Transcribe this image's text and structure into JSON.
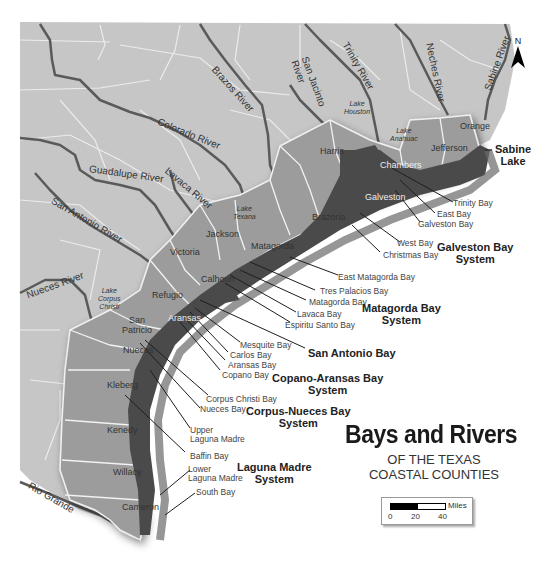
{
  "title": {
    "main": "Bays and Rivers",
    "subtitle_line1": "OF THE TEXAS",
    "subtitle_line2": "COASTAL COUNTIES"
  },
  "north_arrow": {
    "label": "N"
  },
  "scale_bar": {
    "unit": "Miles",
    "ticks": [
      "0",
      "20",
      "40"
    ]
  },
  "rivers": [
    {
      "name": "Brazos River"
    },
    {
      "name": "Colorado River"
    },
    {
      "name": "Guadalupe River"
    },
    {
      "name": "Lavaca River"
    },
    {
      "name": "San Antonio River"
    },
    {
      "name": "Nueces River"
    },
    {
      "name": "Rio Grande"
    },
    {
      "name": "San Jacinto River",
      "line1": "San Jacinto",
      "line2": "River"
    },
    {
      "name": "Trinity River"
    },
    {
      "name": "Neches River"
    },
    {
      "name": "Sabine River"
    }
  ],
  "lakes": [
    {
      "line1": "Lake",
      "line2": "Houston"
    },
    {
      "line1": "Lake",
      "line2": "Anahuac"
    },
    {
      "line1": "Lake",
      "line2": "Texana"
    },
    {
      "line1": "Lake",
      "line2": "Corpus",
      "line3": "Christi"
    }
  ],
  "counties": [
    "Harris",
    "Chambers",
    "Jefferson",
    "Orange",
    "Galveston",
    "Brazoria",
    "Matagorda",
    "Jackson",
    "Victoria",
    "Calhoun",
    "Refugio",
    "Aransas",
    "San Patricio",
    "Nueces",
    "Kleberg",
    "Kenedy",
    "Willacy",
    "Cameron"
  ],
  "san_patricio": {
    "line1": "San",
    "line2": "Patricio"
  },
  "bays": [
    "Trinity Bay",
    "East Bay",
    "Galveston Bay",
    "West Bay",
    "Christmas Bay",
    "East Matagorda Bay",
    "Tres Palacios Bay",
    "Matagorda Bay",
    "Lavaca Bay",
    "Espiritu Santo Bay",
    "Mesquite Bay",
    "Carlos Bay",
    "Aransas Bay",
    "Copano Bay",
    "Corpus Christi Bay",
    "Nueces Bay",
    "Baffin Bay",
    "South Bay"
  ],
  "upper_laguna": {
    "line1": "Upper",
    "line2": "Laguna Madre"
  },
  "lower_laguna": {
    "line1": "Lower",
    "line2": "Laguna Madre"
  },
  "sabine_lake": {
    "line1": "Sabine",
    "line2": "Lake"
  },
  "systems": [
    {
      "line1": "Galveston Bay",
      "line2": "System"
    },
    {
      "line1": "Matagorda Bay",
      "line2": "System"
    },
    {
      "line1": "San Antonio Bay",
      "line2": ""
    },
    {
      "line1": "Copano-Aransas Bay",
      "line2": "System"
    },
    {
      "line1": "Corpus-Nueces Bay",
      "line2": "System"
    },
    {
      "line1": "Laguna Madre",
      "line2": "System"
    }
  ],
  "colors": {
    "land_inland": "#c8c8c8",
    "county_highlight": "#9a9a9a",
    "water": "#4a4a4a",
    "river": "#5e5e5e",
    "county_lines": "#eeeeee",
    "background": "#ffffff"
  }
}
